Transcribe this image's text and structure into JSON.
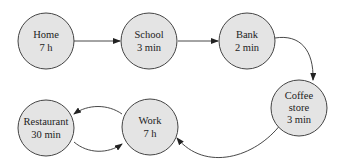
{
  "diagram": {
    "nodes": [
      {
        "id": "home",
        "lines": [
          "Home",
          "7 h"
        ]
      },
      {
        "id": "school",
        "lines": [
          "School",
          "3 min"
        ]
      },
      {
        "id": "bank",
        "lines": [
          "Bank",
          "2 min"
        ]
      },
      {
        "id": "coffee",
        "lines": [
          "Coffee",
          "store",
          "3 min"
        ]
      },
      {
        "id": "work",
        "lines": [
          "Work",
          "7 h"
        ]
      },
      {
        "id": "restaurant",
        "lines": [
          "Restaurant",
          "30 min"
        ]
      }
    ],
    "edges": [
      {
        "from": "home",
        "to": "school"
      },
      {
        "from": "school",
        "to": "bank"
      },
      {
        "from": "bank",
        "to": "coffee"
      },
      {
        "from": "coffee",
        "to": "work"
      },
      {
        "from": "work",
        "to": "restaurant"
      },
      {
        "from": "restaurant",
        "to": "work"
      }
    ]
  }
}
